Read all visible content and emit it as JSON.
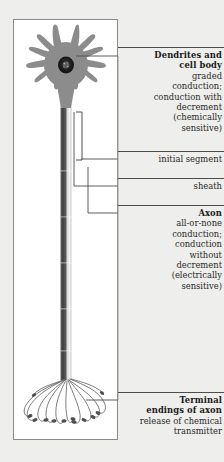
{
  "figure": {
    "title_alt": "Neuron functional regions diagram",
    "panel_border_color": "#8a8a8a",
    "background_color": "#eeeeec",
    "soma_color": "#8c8c8c",
    "nucleus_color": "#1c1c1c",
    "axon_dark_color": "#4a4a4a",
    "axon_light_color": "#e8e8e8",
    "terminal_color": "#6f6f6f",
    "rule_color": "#4d4d4d"
  },
  "labels": [
    {
      "id": "dendrites-and-cell-body",
      "heading": "Dendrites and\ncell body",
      "heading_lines": [
        "Dendrites and",
        "cell body"
      ],
      "body_lines": [
        "graded",
        "conduction;",
        "conduction with",
        "decrement",
        "(chemically",
        "sensitive)"
      ],
      "body": "graded conduction; conduction with decrement (chemically sensitive)"
    },
    {
      "id": "initial-segment",
      "heading": "",
      "heading_lines": [],
      "body_lines": [
        "initial segment"
      ],
      "body": "initial segment"
    },
    {
      "id": "sheath",
      "heading": "",
      "heading_lines": [],
      "body_lines": [
        "sheath"
      ],
      "body": "sheath"
    },
    {
      "id": "axon",
      "heading": "Axon",
      "heading_lines": [
        "Axon"
      ],
      "body_lines": [
        "all-or-none",
        "conduction;",
        "conduction",
        "without",
        "decrement",
        "(electrically",
        "sensitive)"
      ],
      "body": "all-or-none conduction; conduction without decrement (electrically sensitive)"
    },
    {
      "id": "terminal-endings-of-axon",
      "heading": "Terminal\nendings of axon",
      "heading_lines": [
        "Terminal",
        "endings of axon"
      ],
      "body_lines": [
        "release of chemical",
        "transmitter"
      ],
      "body": "release of chemical transmitter"
    }
  ],
  "label_text": {
    "dendrites_h1": "Dendrites and",
    "dendrites_h2": "cell body",
    "dendrites_b1": "graded",
    "dendrites_b2": "conduction;",
    "dendrites_b3": "conduction with",
    "dendrites_b4": "decrement",
    "dendrites_b5": "(chemically",
    "dendrites_b6": "sensitive)",
    "initial_segment": "initial segment",
    "sheath": "sheath",
    "axon_h1": "Axon",
    "axon_b1": "all-or-none",
    "axon_b2": "conduction;",
    "axon_b3": "conduction",
    "axon_b4": "without",
    "axon_b5": "decrement",
    "axon_b6": "(electrically",
    "axon_b7": "sensitive)",
    "terminal_h1": "Terminal",
    "terminal_h2": "endings of axon",
    "terminal_b1": "release of chemical",
    "terminal_b2": "transmitter"
  }
}
